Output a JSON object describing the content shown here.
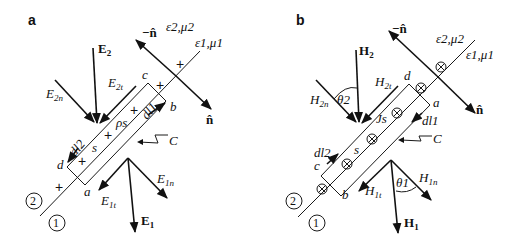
{
  "panels": [
    {
      "label": "a",
      "region_upper": "ε2,μ2",
      "region_lower": "ε1,μ1",
      "normal_up": "−n̂",
      "normal_down": "n̂",
      "field_upper": {
        "main": "E",
        "main_sub": "2",
        "normal": "E",
        "normal_sub": "2n",
        "tangent": "E",
        "tangent_sub": "2t"
      },
      "field_lower": {
        "main": "E",
        "main_sub": "1",
        "normal": "E",
        "normal_sub": "1n",
        "tangent": "E",
        "tangent_sub": "1t"
      },
      "corners": {
        "a": "a",
        "b": "b",
        "c": "c",
        "d": "d"
      },
      "dl1": "dl1",
      "dl2": "dl2",
      "surface_quantity": "ρs",
      "surface_label": "s",
      "contour_label": "C",
      "marker": "+",
      "region_2": "2",
      "region_1": "1"
    },
    {
      "label": "b",
      "region_upper": "ε2,μ2",
      "region_lower": "ε1,μ1",
      "normal_up": "−n̂",
      "normal_down": "n̂",
      "field_upper": {
        "main": "H",
        "main_sub": "2",
        "normal": "H",
        "normal_sub": "2n",
        "tangent": "H",
        "tangent_sub": "2t",
        "angle": "θ2"
      },
      "field_lower": {
        "main": "H",
        "main_sub": "1",
        "normal": "H",
        "normal_sub": "1n",
        "tangent": "H",
        "tangent_sub": "1t",
        "angle": "θ1"
      },
      "corners": {
        "a": "a",
        "b": "b",
        "c": "c",
        "d": "d"
      },
      "dl1": "dl1",
      "dl2": "dl2",
      "surface_quantity": "Js",
      "surface_label": "s",
      "contour_label": "C",
      "marker": "⊗",
      "region_2": "2",
      "region_1": "1"
    }
  ]
}
